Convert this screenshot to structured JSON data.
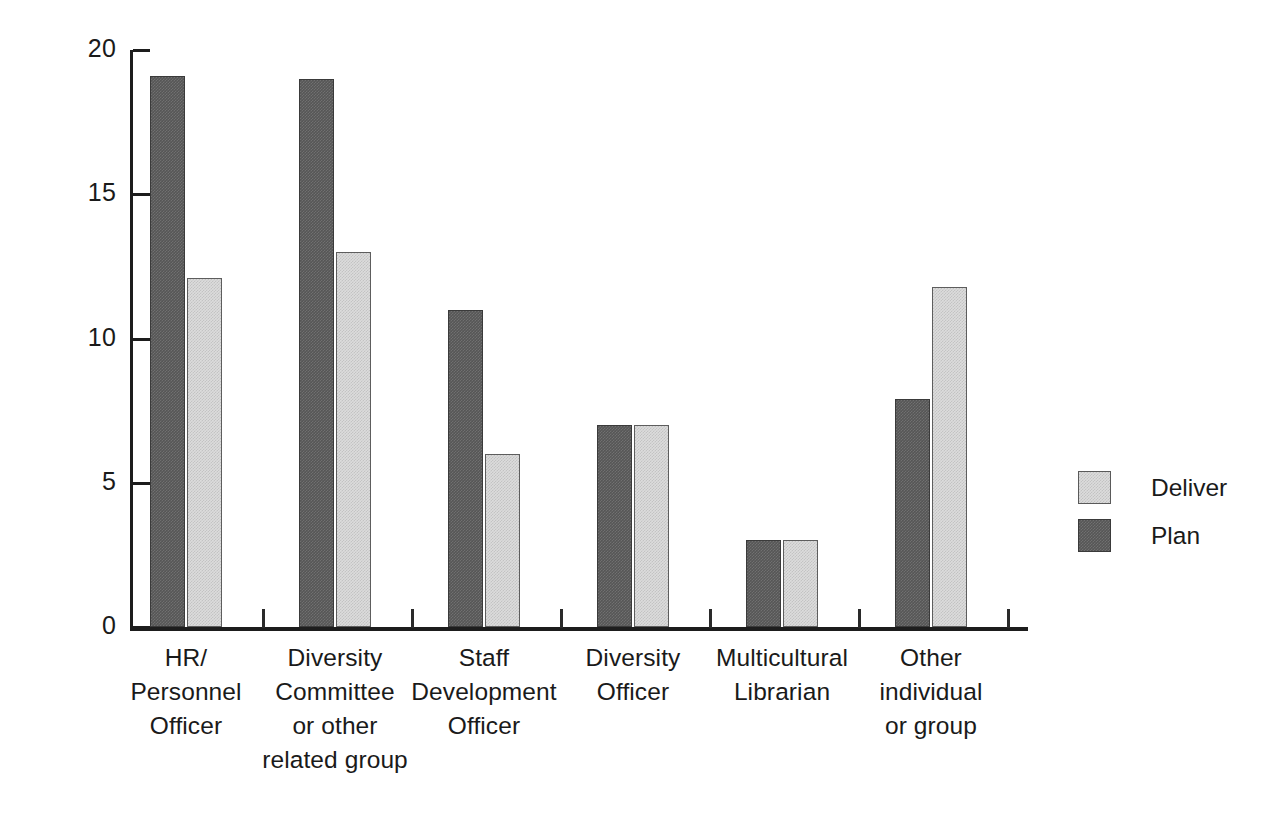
{
  "chart_data": {
    "type": "bar",
    "title": "",
    "subtitle": "",
    "xlabel": "",
    "ylabel": "",
    "ylim": [
      0,
      20
    ],
    "yticks": [
      0,
      5,
      10,
      15,
      20
    ],
    "ytick_labels": [
      "0",
      "5",
      "10",
      "15",
      "20"
    ],
    "grid": false,
    "legend_position": "right",
    "orientation": "vertical",
    "grouping": "grouped",
    "categories": [
      "HR/\nPersonnel\nOfficer",
      "Diversity\nCommittee\nor other\nrelated group",
      "Staff\nDevelopment\nOfficer",
      "Diversity\nOfficer",
      "Multicultural\nLibrarian",
      "Other\nindividual\nor group"
    ],
    "series": [
      {
        "name": "Plan",
        "color": "#565656",
        "values": [
          19.1,
          19.0,
          11.0,
          7.0,
          3.0,
          7.9
        ]
      },
      {
        "name": "Deliver",
        "color": "#dcdcdc",
        "values": [
          12.1,
          13.0,
          6.0,
          7.0,
          3.0,
          11.8
        ]
      }
    ]
  },
  "legend": {
    "entries": [
      {
        "label": "Deliver",
        "swatch": "deliver"
      },
      {
        "label": "Plan",
        "swatch": "plan"
      }
    ]
  },
  "axes": {
    "y_axis_name": "value-axis",
    "x_axis_name": "category-axis"
  },
  "colors": {
    "plan": "#565656",
    "deliver": "#dcdcdc",
    "axis": "#1d1d1d",
    "text": "#1a1a1a",
    "background": "#ffffff"
  }
}
